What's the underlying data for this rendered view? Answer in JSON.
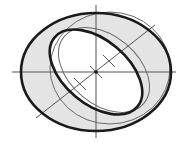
{
  "diagram": {
    "title": "",
    "colors": {
      "background": "#ffffff",
      "ring_fill": "#e4e4e4",
      "thick_stroke": "#1a1a1a",
      "thin_stroke": "#6a6a6a",
      "axis_stroke": "#555555"
    },
    "center": [
      96,
      72
    ],
    "outer_ellipse": {
      "cx": 96,
      "cy": 72,
      "rx": 75,
      "ry": 59
    },
    "outer_thin_ellipse": {
      "cx": 110,
      "cy": 68,
      "rx": 60,
      "ry": 56
    },
    "inner_thick_ellipse": {
      "cx": 96,
      "cy": 72,
      "rx": 54,
      "ry": 32,
      "rotate": 40
    },
    "inner_thin_ellipse": {
      "cx": 104,
      "cy": 70,
      "rx": 52,
      "ry": 34,
      "rotate": 40
    },
    "axes": {
      "vertical": {
        "x": 96,
        "y1": 5,
        "y2": 138
      },
      "horizontal": {
        "y": 72,
        "x1": 12,
        "x2": 176
      },
      "diagonal": {
        "x1": 36,
        "y1": 118,
        "x2": 155,
        "y2": 25
      }
    },
    "tick_marks": [
      {
        "x": 80,
        "y": 84
      },
      {
        "x": 96,
        "y": 72
      },
      {
        "x": 109,
        "y": 61
      }
    ]
  }
}
